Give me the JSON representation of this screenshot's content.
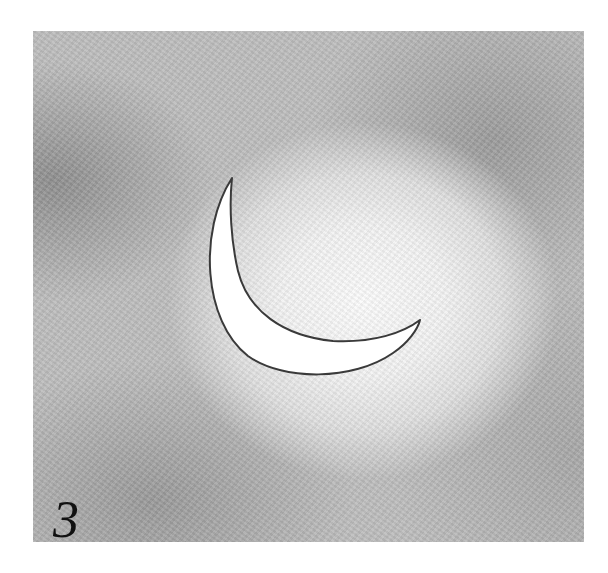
{
  "figure": {
    "label": "3",
    "colors": {
      "background": "#ffffff",
      "panel_base": "#bdbdbd",
      "glow": "#fbfbfb",
      "crescent_fill": "#ffffff",
      "crescent_outline": "#3a3a3a",
      "label": "#111111"
    }
  }
}
